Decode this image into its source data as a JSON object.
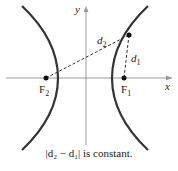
{
  "diagram": {
    "axes": {
      "x_label": "x",
      "y_label": "y"
    },
    "foci": [
      {
        "name": "F2",
        "label": "F",
        "sub": "2"
      },
      {
        "name": "F1",
        "label": "F",
        "sub": "1"
      }
    ],
    "distances": [
      {
        "name": "d2",
        "label": "d",
        "sub": "2"
      },
      {
        "name": "d1",
        "label": "d",
        "sub": "1"
      }
    ],
    "caption": "|d₂ − d₁| is constant.",
    "colors": {
      "curve": "#333333",
      "axis": "#888888",
      "dash": "#333333"
    }
  }
}
